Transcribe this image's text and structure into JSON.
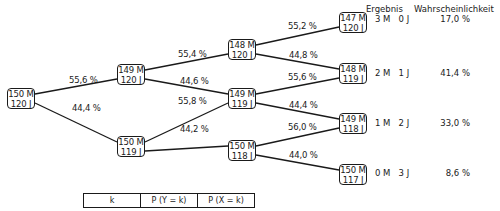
{
  "headers": {
    "outcome": "Ergebnis",
    "probability": "Wahrscheinlichkeit"
  },
  "nodes": [
    {
      "id": "n0",
      "line1": "150 M",
      "line2": "120 J",
      "x": 7,
      "y": 88
    },
    {
      "id": "n1a",
      "line1": "149 M",
      "line2": "120 J",
      "x": 117,
      "y": 64
    },
    {
      "id": "n1b",
      "line1": "150 M",
      "line2": "119 J",
      "x": 117,
      "y": 136
    },
    {
      "id": "n2a",
      "line1": "148 M",
      "line2": "120 J",
      "x": 228,
      "y": 39
    },
    {
      "id": "n2b",
      "line1": "149 M",
      "line2": "119 J",
      "x": 228,
      "y": 88
    },
    {
      "id": "n2c",
      "line1": "150 M",
      "line2": "118 J",
      "x": 228,
      "y": 140
    },
    {
      "id": "n3a",
      "line1": "147 M",
      "line2": "120 J",
      "x": 339,
      "y": 12
    },
    {
      "id": "n3b",
      "line1": "148 M",
      "line2": "119 J",
      "x": 339,
      "y": 63
    },
    {
      "id": "n3c",
      "line1": "149 M",
      "line2": "118 J",
      "x": 339,
      "y": 113
    },
    {
      "id": "n3d",
      "line1": "150 M",
      "line2": "117 J",
      "x": 339,
      "y": 164
    }
  ],
  "edges": [
    {
      "from": "n0",
      "to": "n1a",
      "label": "55,6 %",
      "lx": 69,
      "ly": 75
    },
    {
      "from": "n0",
      "to": "n1b",
      "label": "44,4 %",
      "lx": 72,
      "ly": 103
    },
    {
      "from": "n1a",
      "to": "n2a",
      "label": "55,4 %",
      "lx": 178,
      "ly": 49
    },
    {
      "from": "n1a",
      "to": "n2b",
      "label": "44,6 %",
      "lx": 180,
      "ly": 76
    },
    {
      "from": "n1b",
      "to": "n2b",
      "label": "55,8 %",
      "lx": 178,
      "ly": 96
    },
    {
      "from": "n1b",
      "to": "n2c",
      "label": "44,2 %",
      "lx": 180,
      "ly": 124
    },
    {
      "from": "n2a",
      "to": "n3a",
      "label": "55,2 %",
      "lx": 288,
      "ly": 21
    },
    {
      "from": "n2a",
      "to": "n3b",
      "label": "44,8 %",
      "lx": 289,
      "ly": 50
    },
    {
      "from": "n2b",
      "to": "n3b",
      "label": "55,6 %",
      "lx": 288,
      "ly": 72
    },
    {
      "from": "n2b",
      "to": "n3c",
      "label": "44,4 %",
      "lx": 289,
      "ly": 100
    },
    {
      "from": "n2c",
      "to": "n3c",
      "label": "56,0 %",
      "lx": 288,
      "ly": 122
    },
    {
      "from": "n2c",
      "to": "n3d",
      "label": "44,0 %",
      "lx": 289,
      "ly": 150
    }
  ],
  "results": [
    {
      "outcome": "3 M   0 J",
      "probability": "17,0 %",
      "y": 14
    },
    {
      "outcome": "2 M   1 J",
      "probability": "41,4 %",
      "y": 68
    },
    {
      "outcome": "1 M   2 J",
      "probability": "33,0 %",
      "y": 118
    },
    {
      "outcome": "0 M   3 J",
      "probability": "8,6 %",
      "y": 168
    }
  ],
  "table": {
    "headers": [
      "k",
      "P (Y = k)",
      "P (X = k)"
    ]
  }
}
